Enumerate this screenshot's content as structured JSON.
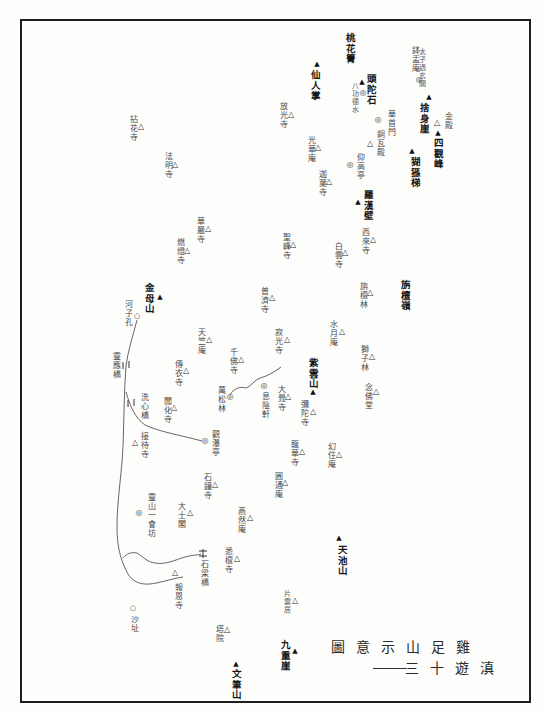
{
  "map": {
    "title": {
      "series": "滇遊十三",
      "name": "雞足山示意圖"
    },
    "places": [
      {
        "name": "太子過玄關",
        "symbol": "none"
      },
      {
        "name": "鉢盂庵",
        "symbol": "site-icon"
      },
      {
        "name": "捨身崖",
        "symbol": "peak-icon"
      },
      {
        "name": "桃花箐",
        "symbol": "none"
      },
      {
        "name": "仙人掌",
        "symbol": "peak-icon"
      },
      {
        "name": "頭陀石",
        "symbol": "peak-icon"
      },
      {
        "name": "八功德水",
        "symbol": "site-icon"
      },
      {
        "name": "華首門",
        "symbol": "site-icon"
      },
      {
        "name": "金殿",
        "symbol": "temple-icon"
      },
      {
        "name": "四觀峰",
        "symbol": "peak-icon"
      },
      {
        "name": "銅瓦殿",
        "symbol": "temple-icon"
      },
      {
        "name": "猢猻梯",
        "symbol": "peak-icon"
      },
      {
        "name": "仰高亭",
        "symbol": "site-icon"
      },
      {
        "name": "羅漢壁",
        "symbol": "peak-icon"
      },
      {
        "name": "放光寺",
        "symbol": "temple-icon"
      },
      {
        "name": "光華庵",
        "symbol": "temple-icon"
      },
      {
        "name": "迦葉寺",
        "symbol": "temple-icon"
      },
      {
        "name": "拈花寺",
        "symbol": "temple-icon"
      },
      {
        "name": "法明寺",
        "symbol": "temple-icon"
      },
      {
        "name": "西來寺",
        "symbol": "temple-icon"
      },
      {
        "name": "白雲寺",
        "symbol": "temple-icon"
      },
      {
        "name": "聖峰寺",
        "symbol": "temple-icon"
      },
      {
        "name": "華嚴寺",
        "symbol": "temple-icon"
      },
      {
        "name": "燃燈寺",
        "symbol": "temple-icon"
      },
      {
        "name": "旃檀嶺",
        "symbol": "none"
      },
      {
        "name": "旃檀林",
        "symbol": "temple-icon"
      },
      {
        "name": "金母山",
        "symbol": "peak-icon"
      },
      {
        "name": "河子孔",
        "symbol": "point-icon"
      },
      {
        "name": "普濟寺",
        "symbol": "temple-icon"
      },
      {
        "name": "水月庵",
        "symbol": "temple-icon"
      },
      {
        "name": "獅子林",
        "symbol": "temple-icon"
      },
      {
        "name": "寂光寺",
        "symbol": "temple-icon"
      },
      {
        "name": "天竺庵",
        "symbol": "temple-icon"
      },
      {
        "name": "千佛寺",
        "symbol": "temple-icon"
      },
      {
        "name": "紫雲山",
        "symbol": "peak-icon"
      },
      {
        "name": "念佛堂",
        "symbol": "temple-icon"
      },
      {
        "name": "大覺寺",
        "symbol": "temple-icon"
      },
      {
        "name": "息陰軒",
        "symbol": "site-icon"
      },
      {
        "name": "萬松林",
        "symbol": "site-icon"
      },
      {
        "name": "彌陀寺",
        "symbol": "temple-icon"
      },
      {
        "name": "觀瀑亭",
        "symbol": "site-icon"
      },
      {
        "name": "龍華寺",
        "symbol": "temple-icon"
      },
      {
        "name": "幻住庵",
        "symbol": "temple-icon"
      },
      {
        "name": "圓通庵",
        "symbol": "temple-icon"
      },
      {
        "name": "石鐘寺",
        "symbol": "temple-icon"
      },
      {
        "name": "靈應橋",
        "symbol": "bridge-icon"
      },
      {
        "name": "傳衣寺",
        "symbol": "temple-icon"
      },
      {
        "name": "洗心橋",
        "symbol": "bridge-icon"
      },
      {
        "name": "聞化寺",
        "symbol": "temple-icon"
      },
      {
        "name": "接待寺",
        "symbol": "temple-icon"
      },
      {
        "name": "大士閣",
        "symbol": "temple-icon"
      },
      {
        "name": "靈山一會坊",
        "symbol": "site-icon"
      },
      {
        "name": "燕然庵",
        "symbol": "temple-icon"
      },
      {
        "name": "悉檀寺",
        "symbol": "temple-icon"
      },
      {
        "name": "石梁橋",
        "symbol": "bridge-icon"
      },
      {
        "name": "報恩寺",
        "symbol": "temple-icon"
      },
      {
        "name": "片雲居",
        "symbol": "temple-icon"
      },
      {
        "name": "沙址",
        "symbol": "point-icon"
      },
      {
        "name": "塔院",
        "symbol": "temple-icon"
      },
      {
        "name": "天池山",
        "symbol": "peak-icon"
      },
      {
        "name": "九重崖",
        "symbol": "peak-icon"
      },
      {
        "name": "文筆山",
        "symbol": "peak-icon"
      }
    ]
  }
}
